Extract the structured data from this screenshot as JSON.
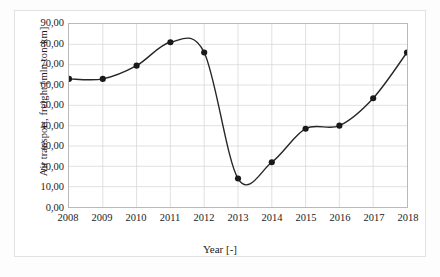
{
  "chart_data": {
    "type": "line",
    "title": "",
    "subtitle": "",
    "xlabel": "Year [-]",
    "ylabel": "Air transport, freight [mln ton-km]",
    "categories": [
      "2008",
      "2009",
      "2010",
      "2011",
      "2012",
      "2013",
      "2014",
      "2015",
      "2016",
      "2017",
      "2018"
    ],
    "x": [
      2008,
      2009,
      2010,
      2011,
      2012,
      2013,
      2014,
      2015,
      2016,
      2017,
      2018
    ],
    "values": [
      63.0,
      63.0,
      69.5,
      81.0,
      76.0,
      14.0,
      22.0,
      38.5,
      40.0,
      53.5,
      76.0
    ],
    "series": [
      {
        "name": "Air transport, freight",
        "values": [
          63.0,
          63.0,
          69.5,
          81.0,
          76.0,
          14.0,
          22.0,
          38.5,
          40.0,
          53.5,
          76.0
        ]
      }
    ],
    "ylim": [
      0,
      90
    ],
    "xlim": [
      2008,
      2018
    ],
    "y_ticks": [
      0,
      10,
      20,
      30,
      40,
      50,
      60,
      70,
      80,
      90
    ],
    "y_tick_labels": [
      "0,00",
      "10,00",
      "20,00",
      "30,00",
      "40,00",
      "50,00",
      "60,00",
      "70,00",
      "80,00",
      "90,00"
    ],
    "x_ticks": [
      2008,
      2009,
      2010,
      2011,
      2012,
      2013,
      2014,
      2015,
      2016,
      2017,
      2018
    ],
    "x_tick_labels": [
      "2008",
      "2009",
      "2010",
      "2011",
      "2012",
      "2013",
      "2014",
      "2015",
      "2016",
      "2017",
      "2018"
    ],
    "grid": true,
    "grid_color": "#d9d9d9",
    "legend": false,
    "legend_position": "none",
    "line_color": "#262626",
    "marker_color": "#1a1a1a",
    "marker": "circle",
    "smoothing": "spline",
    "annotations": []
  },
  "axes": {
    "y_title": "Air transport, freight [mln ton-km]",
    "x_title": "Year [-]"
  }
}
